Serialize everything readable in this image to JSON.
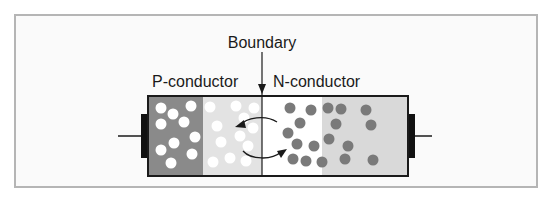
{
  "labels": {
    "boundary": "Boundary",
    "p_conductor": "P-conductor",
    "n_conductor": "N-conductor"
  },
  "colors": {
    "p_dark": "#8a8a8a",
    "p_light": "#e3e3e3",
    "n_white": "#ffffff",
    "n_light": "#d9d9d9",
    "hole": "#ffffff",
    "electron": "#7a7a7a",
    "outline": "#1a1a1a"
  },
  "holes_count": 22,
  "electrons_count": 18
}
